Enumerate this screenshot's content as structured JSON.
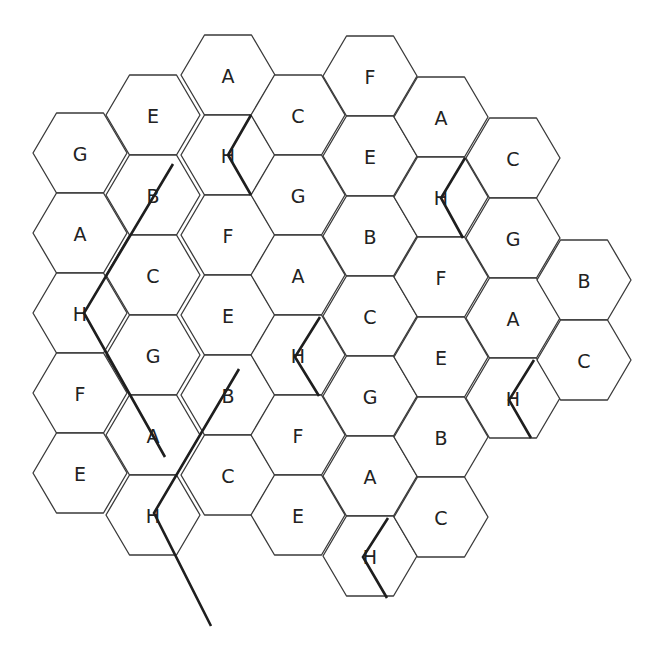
{
  "diagram": {
    "type": "hex-grid",
    "hex": {
      "half_width": 47,
      "half_height": 40,
      "top_half_edge": 23.5
    },
    "columns": [
      {
        "x": 80,
        "y0": 153,
        "labels": [
          "G",
          "A",
          "H",
          "F",
          "E"
        ]
      },
      {
        "x": 153,
        "y0": 115,
        "labels": [
          "E",
          "B",
          "C",
          "G",
          "A",
          "H"
        ]
      },
      {
        "x": 228,
        "y0": 75,
        "labels": [
          "A",
          "H",
          "F",
          "E",
          "B",
          "C"
        ]
      },
      {
        "x": 298,
        "y0": 115,
        "labels": [
          "C",
          "G",
          "A",
          "H",
          "F",
          "E"
        ]
      },
      {
        "x": 370,
        "y0": 76,
        "labels": [
          "F",
          "E",
          "B",
          "C",
          "G",
          "A",
          "H"
        ]
      },
      {
        "x": 441,
        "y0": 117,
        "labels": [
          "A",
          "H",
          "F",
          "E",
          "B",
          "C"
        ]
      },
      {
        "x": 513,
        "y0": 158,
        "labels": [
          "C",
          "G",
          "A",
          "H"
        ]
      },
      {
        "x": 584,
        "y0": 280,
        "labels": [
          "B",
          "C"
        ]
      }
    ],
    "thick_paths": [
      {
        "name": "long-path-left",
        "points": [
          [
            173,
            164
          ],
          [
            84,
            313
          ],
          [
            165,
            457
          ]
        ]
      },
      {
        "name": "long-path-middle",
        "points": [
          [
            239,
            369
          ],
          [
            154,
            513
          ],
          [
            211,
            626
          ]
        ]
      },
      {
        "name": "chevron-h-col2",
        "points": [
          [
            251,
            115
          ],
          [
            228,
            155
          ],
          [
            251,
            195
          ]
        ]
      },
      {
        "name": "chevron-h-col3",
        "points": [
          [
            320,
            317
          ],
          [
            295,
            357
          ],
          [
            319,
            396
          ]
        ]
      },
      {
        "name": "chevron-h-col5",
        "points": [
          [
            465,
            158
          ],
          [
            441,
            198
          ],
          [
            463,
            238
          ]
        ]
      },
      {
        "name": "chevron-h-col6",
        "points": [
          [
            534,
            360
          ],
          [
            509,
            400
          ],
          [
            531,
            438
          ]
        ]
      },
      {
        "name": "chevron-h-col4",
        "points": [
          [
            388,
            518
          ],
          [
            363,
            557
          ],
          [
            387,
            598
          ]
        ]
      }
    ]
  }
}
